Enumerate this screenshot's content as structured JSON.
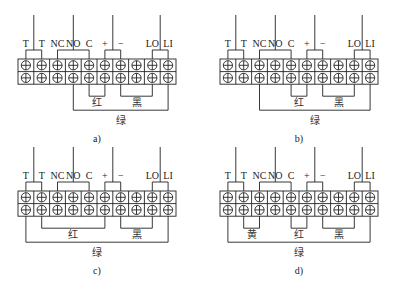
{
  "figure": {
    "terminal_labels": [
      "T",
      "T",
      "NC",
      "NO",
      "C",
      "+",
      "−",
      "",
      "LO",
      "LI"
    ],
    "terminal_count": 10,
    "top_brackets": [
      {
        "name": "T-T",
        "from": 0,
        "to": 1,
        "lead_at": 0.5
      },
      {
        "name": "NC-NO-C",
        "from": 2,
        "to": 4,
        "lead_at": 3
      },
      {
        "name": "plus-minus",
        "from": 5,
        "to": 6,
        "lead_at": 5.5
      },
      {
        "name": "LO-LI",
        "from": 8,
        "to": 9,
        "lead_at": 8.5
      }
    ],
    "panels": [
      {
        "id": "a",
        "caption": "a)",
        "bottom_wires": [
          {
            "label": "红",
            "from": 4,
            "to": 5,
            "level": 1
          },
          {
            "label": "黑",
            "from": 6,
            "to": 8,
            "level": 1
          },
          {
            "label": "绿",
            "from": 3,
            "to": 9,
            "level": 2
          }
        ]
      },
      {
        "id": "b",
        "caption": "b)",
        "bottom_wires": [
          {
            "label": "红",
            "from": 4,
            "to": 5,
            "level": 1
          },
          {
            "label": "黑",
            "from": 6,
            "to": 8,
            "level": 1
          },
          {
            "label": "绿",
            "from": 2,
            "to": 9,
            "level": 2
          }
        ]
      },
      {
        "id": "c",
        "caption": "c)",
        "bottom_wires": [
          {
            "label": "红",
            "from": 1,
            "to": 5,
            "level": 1
          },
          {
            "label": "黑",
            "from": 6,
            "to": 8,
            "level": 1
          },
          {
            "label": "绿",
            "from": 0,
            "to": 9,
            "level": 2
          }
        ]
      },
      {
        "id": "d",
        "caption": "d)",
        "bottom_wires": [
          {
            "label": "黄",
            "from": 1,
            "to": 2,
            "level": 1
          },
          {
            "label": "红",
            "from": 4,
            "to": 5,
            "level": 1
          },
          {
            "label": "黑",
            "from": 6,
            "to": 8,
            "level": 1
          },
          {
            "label": "绿",
            "from": 0,
            "to": 9,
            "level": 2
          }
        ]
      }
    ]
  }
}
